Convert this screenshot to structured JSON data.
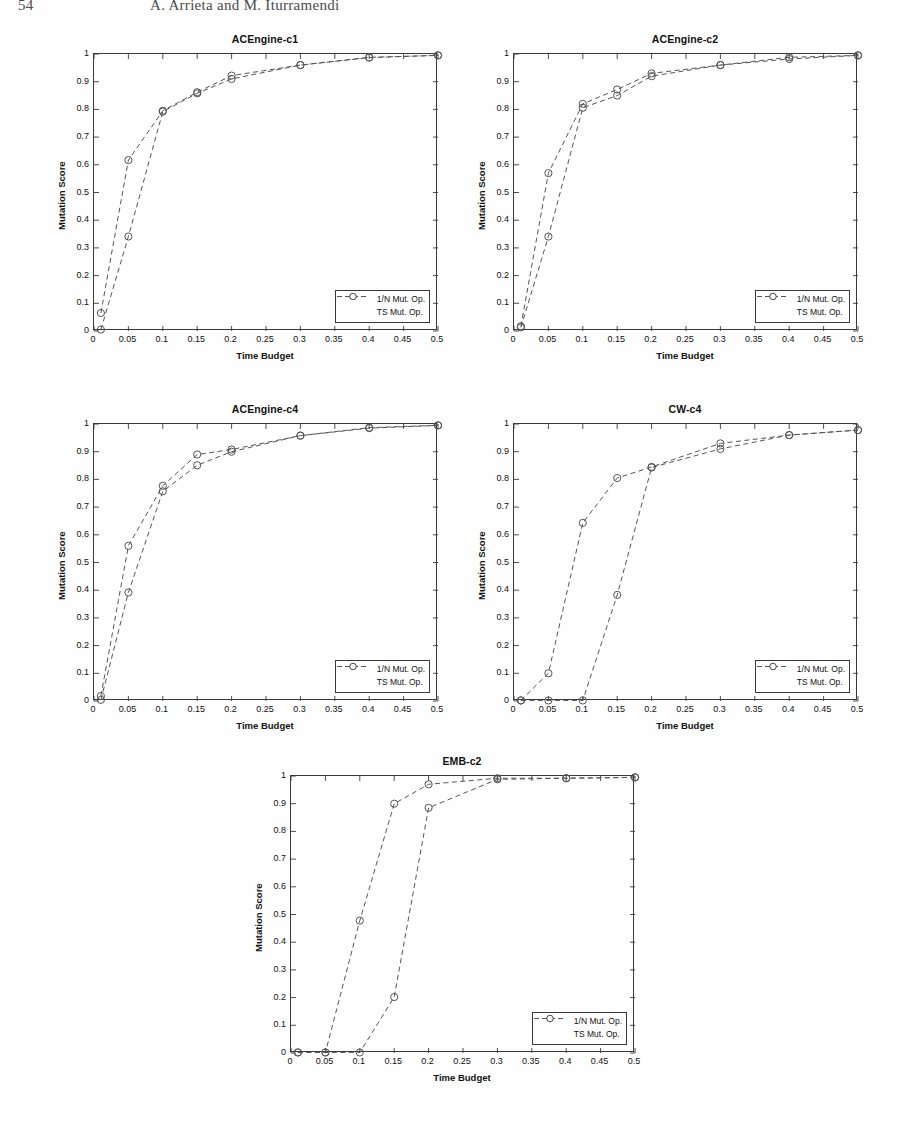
{
  "page": {
    "folio": "54",
    "authors": "A. Arrieta and M. Iturramendi"
  },
  "figure": {
    "legend_labels": [
      "1/N Mut. Op.",
      "TS Mut. Op."
    ],
    "axis": {
      "xlabel": "Time Budget",
      "ylabel": "Mutation Score",
      "xticks": [
        "0",
        "0.05",
        "0.1",
        "0.15",
        "0.2",
        "0.25",
        "0.3",
        "0.35",
        "0.4",
        "0.45",
        "0.5"
      ],
      "yticks": [
        "0",
        "0.1",
        "0.2",
        "0.3",
        "0.4",
        "0.5",
        "0.6",
        "0.7",
        "0.8",
        "0.9",
        "1"
      ],
      "xlim": [
        0,
        0.5
      ],
      "ylim": [
        0,
        1
      ]
    },
    "line_color": "#555555",
    "marker_color": "#555555"
  },
  "chart_data": [
    {
      "type": "line",
      "title": "ACEngine-c1",
      "xlabel": "Time Budget",
      "ylabel": "Mutation Score",
      "xlim": [
        0,
        0.5
      ],
      "ylim": [
        0,
        1
      ],
      "grid": false,
      "legend_position": "lower-right",
      "x": [
        0.01,
        0.05,
        0.1,
        0.15,
        0.2,
        0.3,
        0.4,
        0.5
      ],
      "series": [
        {
          "name": "1/N Mut. Op.",
          "values": [
            0.065,
            0.617,
            0.795,
            0.862,
            0.922,
            0.96,
            0.988,
            0.995
          ]
        },
        {
          "name": "TS Mut. Op.",
          "values": [
            0.005,
            0.341,
            0.792,
            0.858,
            0.91,
            0.96,
            0.987,
            0.995
          ]
        }
      ]
    },
    {
      "type": "line",
      "title": "ACEngine-c2",
      "xlabel": "Time Budget",
      "ylabel": "Mutation Score",
      "xlim": [
        0,
        0.5
      ],
      "ylim": [
        0,
        1
      ],
      "grid": false,
      "legend_position": "lower-right",
      "x": [
        0.01,
        0.05,
        0.1,
        0.15,
        0.2,
        0.3,
        0.4,
        0.5
      ],
      "series": [
        {
          "name": "1/N Mut. Op.",
          "values": [
            0.017,
            0.57,
            0.82,
            0.872,
            0.93,
            0.96,
            0.988,
            0.995
          ]
        },
        {
          "name": "TS Mut. Op.",
          "values": [
            0.013,
            0.341,
            0.806,
            0.85,
            0.92,
            0.96,
            0.982,
            0.995
          ]
        }
      ]
    },
    {
      "type": "line",
      "title": "ACEngine-c4",
      "xlabel": "Time Budget",
      "ylabel": "Mutation Score",
      "xlim": [
        0,
        0.5
      ],
      "ylim": [
        0,
        1
      ],
      "grid": false,
      "legend_position": "lower-right",
      "x": [
        0.01,
        0.05,
        0.1,
        0.15,
        0.2,
        0.3,
        0.4,
        0.5
      ],
      "series": [
        {
          "name": "1/N Mut. Op.",
          "values": [
            0.018,
            0.56,
            0.777,
            0.89,
            0.908,
            0.958,
            0.987,
            0.995
          ]
        },
        {
          "name": "TS Mut. Op.",
          "values": [
            0.004,
            0.392,
            0.757,
            0.851,
            0.9,
            0.958,
            0.985,
            0.995
          ]
        }
      ]
    },
    {
      "type": "line",
      "title": "CW-c4",
      "xlabel": "Time Budget",
      "ylabel": "Mutation Score",
      "xlim": [
        0,
        0.5
      ],
      "ylim": [
        0,
        1
      ],
      "grid": false,
      "legend_position": "lower-right",
      "x": [
        0.01,
        0.05,
        0.1,
        0.15,
        0.2,
        0.3,
        0.4,
        0.5
      ],
      "series": [
        {
          "name": "1/N Mut. Op.",
          "values": [
            0.002,
            0.1,
            0.643,
            0.805,
            0.845,
            0.93,
            0.96,
            0.978
          ]
        },
        {
          "name": "TS Mut. Op.",
          "values": [
            0.002,
            0.002,
            0.002,
            0.383,
            0.843,
            0.91,
            0.96,
            0.978
          ]
        }
      ]
    },
    {
      "type": "line",
      "title": "EMB-c2",
      "xlabel": "Time Budget",
      "ylabel": "Mutation Score",
      "xlim": [
        0,
        0.5
      ],
      "ylim": [
        0,
        1
      ],
      "grid": false,
      "legend_position": "lower-right",
      "x": [
        0.01,
        0.05,
        0.1,
        0.15,
        0.2,
        0.3,
        0.4,
        0.5
      ],
      "series": [
        {
          "name": "1/N Mut. Op.",
          "values": [
            0.002,
            0.002,
            0.478,
            0.9,
            0.97,
            0.992,
            0.992,
            0.995
          ]
        },
        {
          "name": "TS Mut. Op.",
          "values": [
            0.002,
            0.002,
            0.002,
            0.202,
            0.885,
            0.988,
            0.992,
            0.995
          ]
        }
      ]
    }
  ]
}
